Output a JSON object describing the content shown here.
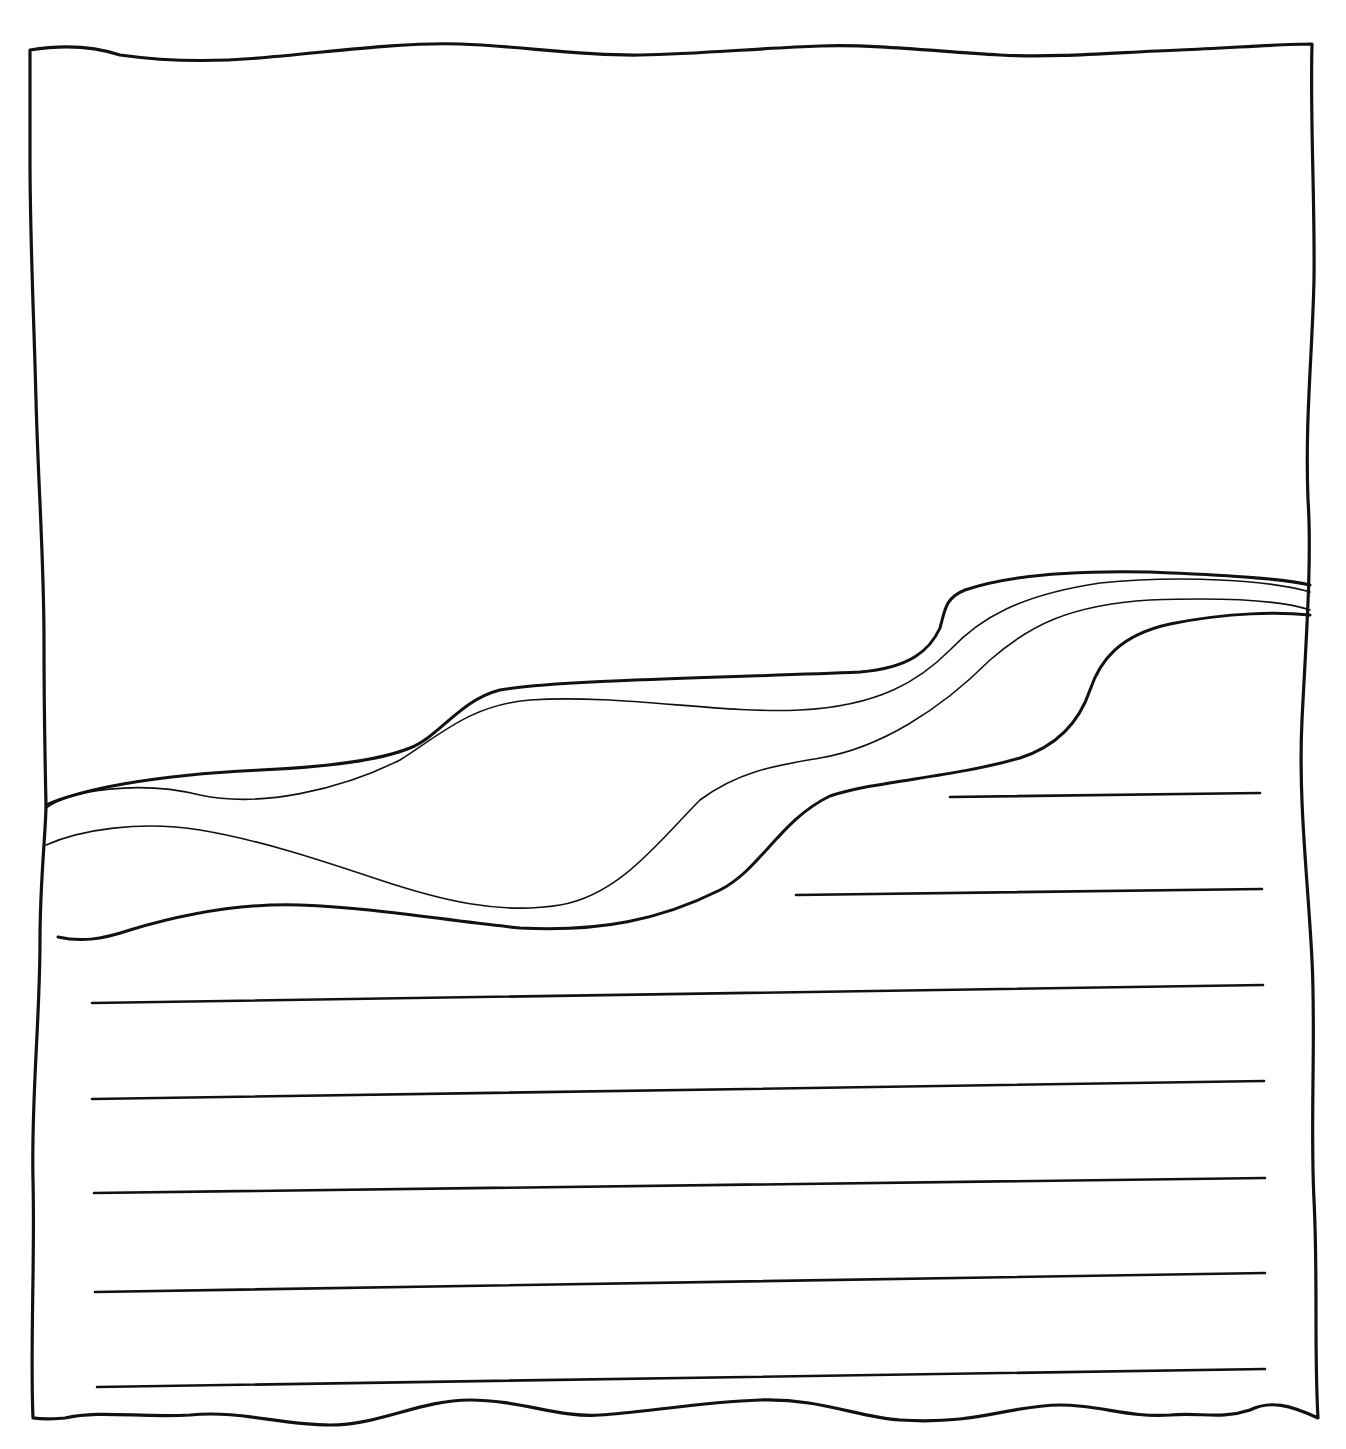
{
  "page": {
    "clipped_header_text": "",
    "background": "#ffffff",
    "ink_color": "#111111"
  },
  "drawing": {
    "subject": "hand-drawn worksheet page with wavy border, layered wavy bands (river/landscape), and writing lines",
    "frame": {
      "shape": "wavy-rectangle",
      "approx_bounds": {
        "x": 30,
        "y": 42,
        "w": 1285,
        "h": 1378
      }
    },
    "bands": [
      {
        "name": "top-boundary",
        "weight": "thick"
      },
      {
        "name": "inner-top",
        "weight": "thin"
      },
      {
        "name": "inner-bottom",
        "weight": "thin"
      },
      {
        "name": "bottom-boundary",
        "weight": "thick"
      }
    ],
    "writing_lines": [
      {
        "x1": 950,
        "y1": 797,
        "x2": 1260,
        "y2": 793
      },
      {
        "x1": 796,
        "y1": 895,
        "x2": 1262,
        "y2": 889
      },
      {
        "x1": 92,
        "y1": 1003,
        "x2": 1263,
        "y2": 985
      },
      {
        "x1": 92,
        "y1": 1099,
        "x2": 1264,
        "y2": 1081
      },
      {
        "x1": 94,
        "y1": 1193,
        "x2": 1265,
        "y2": 1178
      },
      {
        "x1": 95,
        "y1": 1292,
        "x2": 1265,
        "y2": 1273
      },
      {
        "x1": 97,
        "y1": 1387,
        "x2": 1265,
        "y2": 1369
      }
    ]
  }
}
